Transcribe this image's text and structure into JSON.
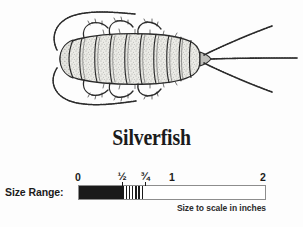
{
  "page": {
    "background_color": "#fdfdfd",
    "ink_color": "#1b1b1b"
  },
  "illustration": {
    "name": "silverfish-line-drawing",
    "subject": "Silverfish",
    "description": "Top-down black-and-white stippled line drawing of a silverfish insect, head at left with two long curved antennae, tapering segmented body, six legs, and three long tail filaments at right",
    "stroke_color": "#2b2b2b",
    "fill_color": "#e8e8e4"
  },
  "common_name": {
    "text": "Silverfish"
  },
  "size_range": {
    "label": "Size Range:",
    "caption": "Size to scale in inches",
    "units": "inches",
    "axis_min": 0,
    "axis_max": 2,
    "range_typical_min": 0,
    "range_typical_max": 0.5,
    "range_extended_max": 0.75,
    "ticks": [
      {
        "value": 0,
        "label": "0"
      },
      {
        "value": 0.5,
        "label": "½"
      },
      {
        "value": 0.75,
        "label": "¾"
      },
      {
        "value": 1,
        "label": "1"
      },
      {
        "value": 2,
        "label": "2"
      }
    ],
    "fill_solid_color": "#1a1a1a",
    "fill_hatch_color": "#1a1a1a",
    "track_border_color": "#8d8d8d"
  }
}
